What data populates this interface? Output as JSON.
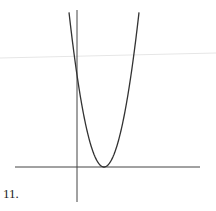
{
  "problem": {
    "number_label": "11."
  },
  "graph": {
    "description": "Upward-opening parabola with vertex on the positive x-axis, tangent to the x-axis",
    "axes": {
      "x_axis": {
        "x1": 15,
        "y": 167,
        "x2": 200
      },
      "y_axis": {
        "x": 77,
        "y1": 10,
        "y2": 202
      }
    },
    "parabola": {
      "vertex": [
        104,
        167
      ],
      "y_intercept_pixel": [
        77,
        75
      ],
      "color": "#333333"
    },
    "scan_artifact_line": {
      "from": [
        0,
        58
      ],
      "to": [
        216,
        53
      ],
      "color": "#e6e6e6"
    }
  }
}
